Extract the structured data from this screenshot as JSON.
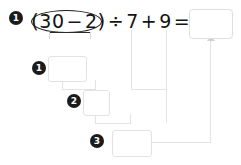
{
  "problem": {
    "step_number_label": "1",
    "expression": {
      "open_paren": "(",
      "operand_a": "30",
      "operator_1": "−",
      "operand_b": "2",
      "close_paren": ")",
      "operator_2": "÷",
      "operand_c": "7",
      "operator_3": "+",
      "operand_d": "9",
      "equals": "="
    },
    "highlight_shape": "oval-around-parenthesis",
    "answer_box": {
      "value": "",
      "placeholder": ""
    }
  },
  "steps": [
    {
      "badge": "1",
      "label": "step-1",
      "value": "",
      "placeholder": ""
    },
    {
      "badge": "2",
      "label": "step-2",
      "value": "",
      "placeholder": ""
    },
    {
      "badge": "3",
      "label": "step-3",
      "value": "",
      "placeholder": ""
    }
  ],
  "colors": {
    "badge_fill": "#1b1b1b",
    "badge_text": "#ffffff",
    "expression_text": "#141414",
    "oval_stroke": "#1d1d1d",
    "bracket_stroke": "#2a2a2a",
    "connector": "#e3e3e3",
    "box_border": "#e2e2e2",
    "answer_box_border": "#dfdfdf",
    "arrow_fill": "#cfcfcf",
    "background": "#ffffff"
  },
  "icons": {
    "arrow_up": "arrow-up-icon",
    "bracket": "brace-under-icon"
  }
}
